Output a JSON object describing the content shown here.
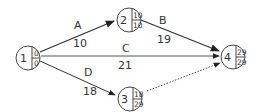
{
  "diagram": {
    "type": "activity-on-arrow network",
    "nodes": [
      {
        "id": "1",
        "early": "0",
        "late": "0"
      },
      {
        "id": "2",
        "early": "10",
        "late": "10"
      },
      {
        "id": "3",
        "early": "18",
        "late": "29"
      },
      {
        "id": "4",
        "early": "29",
        "late": "29"
      }
    ],
    "edges": [
      {
        "from": "1",
        "to": "2",
        "activity": "A",
        "duration": "10",
        "style": "solid"
      },
      {
        "from": "2",
        "to": "4",
        "activity": "B",
        "duration": "19",
        "style": "solid"
      },
      {
        "from": "1",
        "to": "4",
        "activity": "C",
        "duration": "21",
        "style": "solid"
      },
      {
        "from": "1",
        "to": "3",
        "activity": "D",
        "duration": "18",
        "style": "solid"
      },
      {
        "from": "3",
        "to": "4",
        "activity": "",
        "duration": "",
        "style": "dotted"
      }
    ]
  }
}
